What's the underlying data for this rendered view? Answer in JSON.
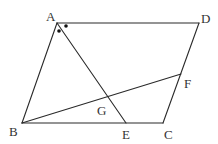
{
  "diagram": {
    "type": "geometry-parallelogram",
    "points": {
      "A": {
        "label": "A",
        "x": 57,
        "y": 23,
        "lx": 46,
        "ly": 21
      },
      "D": {
        "label": "D",
        "x": 199,
        "y": 23,
        "lx": 201,
        "ly": 23
      },
      "B": {
        "label": "B",
        "x": 22,
        "y": 123,
        "lx": 9,
        "ly": 136
      },
      "C": {
        "label": "C",
        "x": 163,
        "y": 123,
        "lx": 164,
        "ly": 139
      },
      "E": {
        "label": "E",
        "x": 126,
        "y": 123,
        "lx": 122,
        "ly": 139
      },
      "F": {
        "label": "F",
        "x": 181,
        "y": 74,
        "lx": 184,
        "ly": 88
      },
      "G": {
        "label": "G",
        "x": 108,
        "y": 97,
        "lx": 97,
        "ly": 115
      }
    },
    "segments": [
      {
        "name": "segment-ad",
        "from": "A",
        "to": "D"
      },
      {
        "name": "segment-dc",
        "from": "D",
        "to": "C"
      },
      {
        "name": "segment-cb",
        "from": "C",
        "to": "B"
      },
      {
        "name": "segment-ba",
        "from": "B",
        "to": "A"
      },
      {
        "name": "segment-ae",
        "from": "A",
        "to": "E"
      },
      {
        "name": "segment-bf",
        "from": "B",
        "to": "F"
      }
    ],
    "angle_marks": [
      {
        "name": "angle-mark-bae",
        "x": 59,
        "y": 31
      },
      {
        "name": "angle-mark-ead",
        "x": 66,
        "y": 26
      }
    ]
  }
}
